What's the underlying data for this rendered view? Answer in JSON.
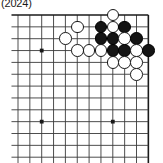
{
  "caption": "(2024)",
  "diagram": {
    "kind": "go-board-corner",
    "board_size": 19,
    "visible_columns": 11,
    "visible_rows": 12,
    "colors": {
      "background": "#ffffff",
      "grid_line": "#3a3a3a",
      "edge_line": "#1a1a1a",
      "black_stone": "#141414",
      "white_stone": "#ffffff",
      "stone_outline": "#1a1a1a"
    },
    "geometry": {
      "origin_x": 18,
      "origin_y": 15,
      "spacing": 11.85,
      "cols": 11,
      "rows": 12,
      "stone_diameter": 12.6
    },
    "star_points": [
      {
        "col": 2,
        "row": 3
      },
      {
        "col": 2,
        "row": 9
      },
      {
        "col": 8,
        "row": 9
      }
    ],
    "edges": {
      "top": true,
      "right": true,
      "left": false,
      "bottom": false
    },
    "stones": [
      {
        "col": 8,
        "row": 0,
        "color": "white"
      },
      {
        "col": 5,
        "row": 1,
        "color": "white"
      },
      {
        "col": 7,
        "row": 1,
        "color": "black"
      },
      {
        "col": 8,
        "row": 1,
        "color": "white"
      },
      {
        "col": 9,
        "row": 1,
        "color": "black"
      },
      {
        "col": 4,
        "row": 2,
        "color": "white"
      },
      {
        "col": 7,
        "row": 2,
        "color": "black"
      },
      {
        "col": 8,
        "row": 2,
        "color": "black"
      },
      {
        "col": 9,
        "row": 2,
        "color": "white"
      },
      {
        "col": 10,
        "row": 2,
        "color": "black"
      },
      {
        "col": 5,
        "row": 3,
        "color": "white"
      },
      {
        "col": 6,
        "row": 3,
        "color": "white"
      },
      {
        "col": 7,
        "row": 3,
        "color": "white"
      },
      {
        "col": 8,
        "row": 3,
        "color": "black"
      },
      {
        "col": 9,
        "row": 3,
        "color": "black"
      },
      {
        "col": 10,
        "row": 3,
        "color": "white"
      },
      {
        "col": 11,
        "row": 3,
        "color": "black"
      },
      {
        "col": 8,
        "row": 4,
        "color": "white"
      },
      {
        "col": 9,
        "row": 4,
        "color": "white"
      },
      {
        "col": 10,
        "row": 4,
        "color": "white"
      },
      {
        "col": 10,
        "row": 5,
        "color": "white"
      }
    ]
  }
}
